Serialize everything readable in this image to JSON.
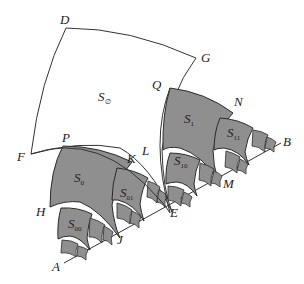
{
  "figure": {
    "colors": {
      "shade": "#8f8f8f",
      "stroke": "#2a2a2a",
      "background": "#ffffff"
    },
    "points": {
      "A": "A",
      "B": "B",
      "D": "D",
      "E": "E",
      "F": "F",
      "G": "G",
      "H": "H",
      "J": "J",
      "K": "K",
      "L": "L",
      "M": "M",
      "N": "N",
      "P": "P",
      "Q": "Q"
    },
    "regions": {
      "root": {
        "base": "S",
        "sub": "∅"
      },
      "s0": {
        "base": "S",
        "sub": "0"
      },
      "s1": {
        "base": "S",
        "sub": "1"
      },
      "s00": {
        "base": "S",
        "sub": "00"
      },
      "s01": {
        "base": "S",
        "sub": "01"
      },
      "s10": {
        "base": "S",
        "sub": "10"
      },
      "s11": {
        "base": "S",
        "sub": "11"
      }
    }
  }
}
